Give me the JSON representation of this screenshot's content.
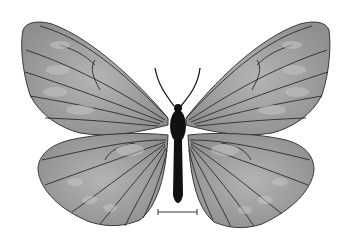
{
  "image": {
    "subject": "butterfly specimen, dorsal view",
    "style": "grayscale",
    "background": "#ffffff",
    "colors": {
      "wing_fill": "#9a9a9a",
      "wing_light": "#b8b8b8",
      "vein": "#2a2a2a",
      "body": "#111111"
    }
  },
  "scale_bar": {
    "label": "",
    "x1": 158,
    "x2": 197,
    "y": 212
  }
}
